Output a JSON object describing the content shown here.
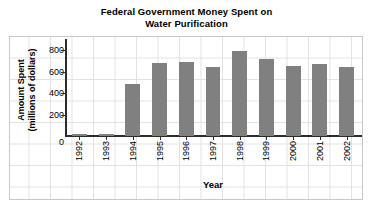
{
  "chart_data": {
    "type": "bar",
    "title": "Federal Government Money Spent on Water Purification",
    "title_line1": "Federal Government Money Spent on",
    "title_line2": "Water Purification",
    "xlabel": "Year",
    "ylabel": "Amount Spent (millions of dollars)",
    "ylabel_line1": "Amount Spent",
    "ylabel_line2": "(millions of dollars)",
    "categories": [
      "1992",
      "1993",
      "1994",
      "1995",
      "1996",
      "1997",
      "1998",
      "1999",
      "2000",
      "2001",
      "2002"
    ],
    "values": [
      20,
      20,
      480,
      670,
      680,
      635,
      780,
      710,
      640,
      660,
      630
    ],
    "ylim": [
      0,
      880
    ],
    "yticks": [
      0,
      200,
      400,
      600,
      800
    ],
    "ytick_labels": [
      "0",
      "200",
      "400",
      "600",
      "800"
    ],
    "grid": true,
    "legend": false,
    "bar_color": "#808080",
    "axis_color": "#2b2b2b",
    "grid_color": "#e2e2e2",
    "background_color": "#ffffff"
  }
}
